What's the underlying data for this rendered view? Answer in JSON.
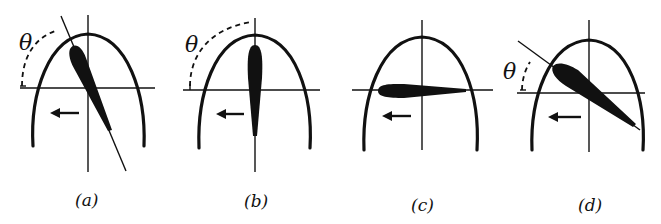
{
  "figure": {
    "colors": {
      "ink": "#111111",
      "background": "#ffffff"
    },
    "panels": [
      {
        "id": "a",
        "caption": "(a)",
        "angle_label": "θ",
        "airfoil_orientation": "tilted steeply (leading edge upper-left)",
        "arrow_direction": "left"
      },
      {
        "id": "b",
        "caption": "(b)",
        "angle_label": "θ",
        "airfoil_orientation": "vertical",
        "arrow_direction": "left"
      },
      {
        "id": "c",
        "caption": "(c)",
        "angle_label": "",
        "airfoil_orientation": "horizontal",
        "arrow_direction": "left"
      },
      {
        "id": "d",
        "caption": "(d)",
        "angle_label": "θ",
        "airfoil_orientation": "tilted shallow (leading edge upper-left)",
        "arrow_direction": "left"
      }
    ]
  }
}
